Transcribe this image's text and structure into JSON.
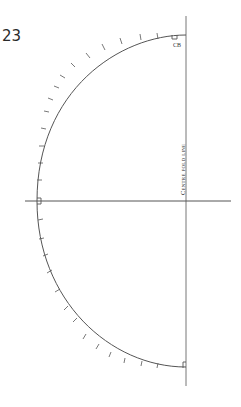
{
  "page": {
    "number": "23"
  },
  "pattern": {
    "centre_back_label": "CB",
    "fold_label": "Centre fold line",
    "line_color": "#555555"
  }
}
